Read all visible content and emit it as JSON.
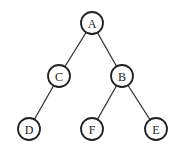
{
  "diagram": {
    "type": "binary-tree",
    "nodes": [
      {
        "id": "A",
        "label": "A",
        "x": 92,
        "y": 23
      },
      {
        "id": "C",
        "label": "C",
        "x": 59,
        "y": 76
      },
      {
        "id": "B",
        "label": "B",
        "x": 122,
        "y": 76
      },
      {
        "id": "D",
        "label": "D",
        "x": 29,
        "y": 129
      },
      {
        "id": "F",
        "label": "F",
        "x": 92,
        "y": 129
      },
      {
        "id": "E",
        "label": "E",
        "x": 156,
        "y": 129
      }
    ],
    "edges": [
      {
        "from": "A",
        "to": "C"
      },
      {
        "from": "A",
        "to": "B"
      },
      {
        "from": "C",
        "to": "D"
      },
      {
        "from": "B",
        "to": "F"
      },
      {
        "from": "B",
        "to": "E"
      }
    ]
  }
}
